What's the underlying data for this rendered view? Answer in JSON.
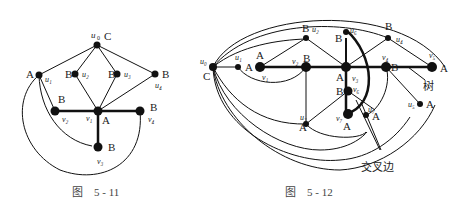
{
  "figure_1": {
    "caption": "图　5 - 11",
    "vertices": [
      {
        "id": "u0",
        "name": "u₀",
        "color": "C"
      },
      {
        "id": "u1",
        "name": "u₁",
        "color": "A"
      },
      {
        "id": "u2",
        "name": "u₂",
        "color": "B"
      },
      {
        "id": "u3",
        "name": "u₃",
        "color": "B"
      },
      {
        "id": "u4",
        "name": "u₄",
        "color": "B"
      },
      {
        "id": "v1",
        "name": "v₁",
        "color": "A"
      },
      {
        "id": "v2",
        "name": "v₂",
        "color": "B"
      },
      {
        "id": "v3",
        "name": "v₃",
        "color": "B"
      },
      {
        "id": "v4",
        "name": "v₄",
        "color": "B"
      }
    ]
  },
  "figure_2": {
    "caption": "图　5 - 12",
    "tree_label": "树",
    "cross_edge_label": "交叉边",
    "vertices": [
      {
        "id": "u0",
        "name": "u₀",
        "color": "C"
      },
      {
        "id": "u1",
        "name": "u₁",
        "color": "A"
      },
      {
        "id": "u2",
        "name": "u₂",
        "color": "B"
      },
      {
        "id": "u3",
        "name": "u₃",
        "color": "A"
      },
      {
        "id": "u4",
        "name": "u₄",
        "color": "B"
      },
      {
        "id": "u5",
        "name": "u₅",
        "color": "A"
      },
      {
        "id": "u6",
        "name": "u₆",
        "color": "B"
      },
      {
        "id": "u7",
        "name": "u₇",
        "color": "A"
      },
      {
        "id": "v1",
        "name": "v₁",
        "color": "A"
      },
      {
        "id": "v2",
        "name": "v₂",
        "color": "B"
      },
      {
        "id": "v3",
        "name": "v₃",
        "color": "A"
      },
      {
        "id": "v4",
        "name": "v₄",
        "color": "B"
      },
      {
        "id": "v5",
        "name": "v₅",
        "color": "A"
      },
      {
        "id": "v6",
        "name": "v₆",
        "color": "B"
      },
      {
        "id": "v7",
        "name": "v₇",
        "color": "A"
      }
    ]
  }
}
